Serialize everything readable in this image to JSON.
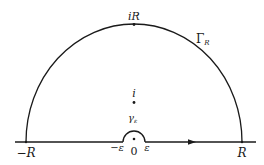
{
  "figure": {
    "type": "contour-diagram",
    "colors": {
      "stroke": "#1a1a1a",
      "background": "#ffffff"
    },
    "labels": {
      "top_point": "iR",
      "big_arc": "Γ",
      "big_arc_sub": "R",
      "pole": "i",
      "small_arc": "γ",
      "small_arc_sub": "ε",
      "left_end": "−R",
      "right_end": "R",
      "neg_eps": "−ε",
      "origin": "0",
      "pos_eps": "ε"
    },
    "points": {
      "origin": [
        134,
        142
      ],
      "pole": [
        134,
        103
      ],
      "top": [
        134,
        24
      ],
      "left_end": [
        26,
        142
      ],
      "right_end": [
        242,
        142
      ]
    },
    "radius_big_px": 108,
    "radius_small_px": 11,
    "arrow_direction": "right"
  }
}
